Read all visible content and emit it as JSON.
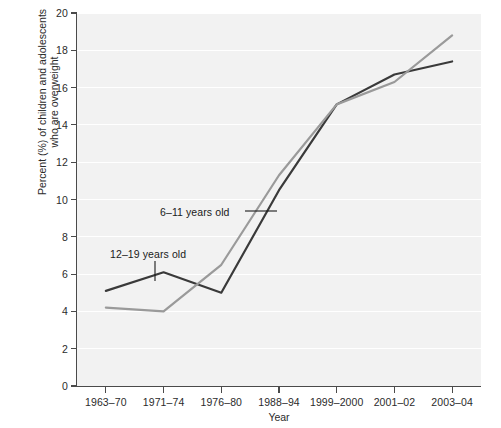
{
  "chart_data": {
    "type": "line",
    "title": "",
    "xlabel": "Year",
    "ylabel_line1": "Percent (%) of children and adolescents",
    "ylabel_line2": "who are overweight",
    "categories": [
      "1963–70",
      "1971–74",
      "1976–80",
      "1988–94",
      "1999–2000",
      "2001–02",
      "2003–04"
    ],
    "ylim": [
      0,
      20
    ],
    "yticks": [
      0,
      2,
      4,
      6,
      8,
      10,
      12,
      14,
      16,
      18,
      20
    ],
    "ytick_labels": [
      "0",
      "2",
      "4",
      "6",
      "8",
      "10",
      "12",
      "14",
      "16",
      "18",
      "20"
    ],
    "grid": true,
    "grid_axis": "y",
    "legend_position": "inline-annotations",
    "series": [
      {
        "name": "6–11 years old",
        "color": "#9a9a9a",
        "values": [
          4.2,
          4.0,
          6.5,
          11.3,
          15.1,
          16.3,
          18.8
        ]
      },
      {
        "name": "12–19 years old",
        "color": "#3a3a3a",
        "values": [
          5.1,
          6.1,
          5.0,
          10.5,
          15.1,
          16.7,
          17.4
        ]
      }
    ],
    "annotations": [
      {
        "id": "annot-6-11",
        "text": "6–11 years old",
        "points_to": "6–11 years old series"
      },
      {
        "id": "annot-12-19",
        "text": "12–19 years old",
        "points_to": "12–19 years old series at 1971–74"
      }
    ]
  }
}
